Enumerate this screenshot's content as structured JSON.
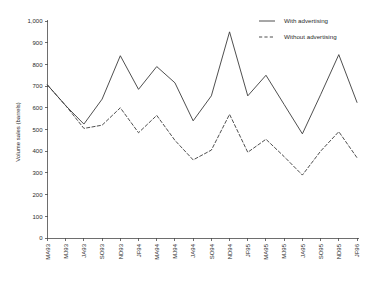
{
  "chart_data": {
    "type": "line",
    "title": "",
    "subtitle": "",
    "xlabel": "",
    "ylabel": "Volume sales (barrels)",
    "ylim": [
      0,
      1000
    ],
    "ytick_step": 100,
    "grid": false,
    "legend_position": "top-right",
    "categories": [
      "MA93",
      "MJ93",
      "JA93",
      "SO93",
      "ND93",
      "JF94",
      "MA94",
      "MJ94",
      "JA94",
      "SO94",
      "ND94",
      "JF95",
      "MA95",
      "MJ95",
      "JA95",
      "SO95",
      "ND95",
      "JF96"
    ],
    "ytick_labels": [
      "0",
      "100",
      "200",
      "300",
      "400",
      "500",
      "600",
      "700",
      "800",
      "900",
      "1,000"
    ],
    "ytick_values": [
      0,
      100,
      200,
      300,
      400,
      500,
      600,
      700,
      800,
      900,
      1000
    ],
    "series": [
      {
        "name": "With advertising",
        "style": "solid",
        "color": "#3b3b3b",
        "values": [
          705,
          610,
          525,
          640,
          840,
          685,
          790,
          715,
          540,
          655,
          950,
          655,
          750,
          615,
          480,
          660,
          845,
          625
        ]
      },
      {
        "name": "Without advertising",
        "style": "dashed",
        "color": "#3b3b3b",
        "values": [
          705,
          610,
          505,
          520,
          600,
          485,
          565,
          450,
          360,
          405,
          570,
          395,
          455,
          375,
          290,
          400,
          490,
          370
        ]
      }
    ],
    "annotations": []
  },
  "legend": {
    "entries": [
      {
        "label": "With advertising",
        "style": "solid"
      },
      {
        "label": "Without advertising",
        "style": "dashed"
      }
    ]
  }
}
